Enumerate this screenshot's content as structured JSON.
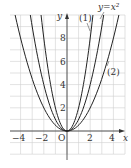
{
  "chart_data": {
    "type": "line",
    "title": "",
    "xlabel": "x",
    "ylabel": "y",
    "xlim": [
      -5,
      5
    ],
    "ylim": [
      -2,
      10
    ],
    "grid": true,
    "x_ticks": [
      "-4",
      "-2",
      "O",
      "2",
      "4"
    ],
    "y_ticks": [
      "2",
      "4",
      "6",
      "8"
    ],
    "origin_label": "O",
    "series": [
      {
        "name": "y=x^2",
        "label": "y=x²",
        "formula": "x^2",
        "coef": 1
      },
      {
        "name": "(1)",
        "label": "(1)",
        "formula": "2x^2",
        "coef": 2
      },
      {
        "name": "(2)",
        "label": "(2)",
        "formula": "x^2/2",
        "coef": 0.5
      }
    ]
  },
  "labels": {
    "x_axis": "x",
    "y_axis": "y",
    "origin": "O",
    "curve_main": "y=x²",
    "curve_1": "(1)",
    "curve_2": "(2)",
    "tick_x_neg4": "−4",
    "tick_x_neg2": "−2",
    "tick_x_2": "2",
    "tick_x_4": "4",
    "tick_y_2": "2",
    "tick_y_4": "4",
    "tick_y_6": "6",
    "tick_y_8": "8"
  }
}
